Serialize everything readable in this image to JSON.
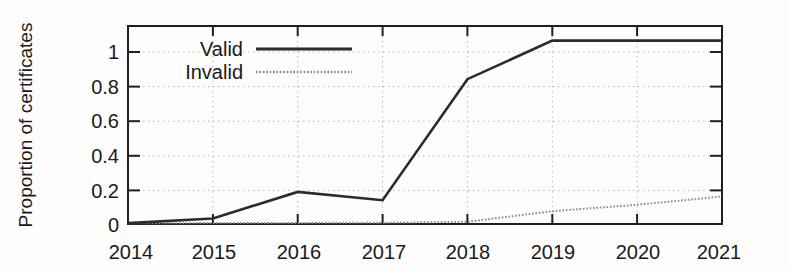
{
  "chart_data": {
    "type": "line",
    "title": "",
    "subtitle": "",
    "xlabel": "",
    "ylabel": "Proportion of certificates",
    "xlim": [
      2014,
      2021
    ],
    "ylim": [
      0,
      1.08
    ],
    "grid": true,
    "legend_position": "top-left",
    "x_ticks": [
      "2014",
      "2015",
      "2016",
      "2017",
      "2018",
      "2019",
      "2020",
      "2021"
    ],
    "y_ticks": [
      "0",
      "0.2",
      "0.4",
      "0.6",
      "0.8",
      "1"
    ],
    "x": [
      2014,
      2015,
      2016,
      2017,
      2018,
      2019,
      2020,
      2021
    ],
    "series": [
      {
        "name": "Valid",
        "color": "#2b2b2b",
        "style": "solid",
        "values": [
          0.005,
          0.03,
          0.175,
          0.13,
          0.79,
          1.0,
          1.0,
          1.0
        ]
      },
      {
        "name": "Invalid",
        "color": "#8c8c8c",
        "style": "dotted",
        "values": [
          0.004,
          0.005,
          0.006,
          0.007,
          0.012,
          0.07,
          0.105,
          0.15
        ]
      }
    ],
    "annotations": []
  },
  "legend": {
    "entries": [
      {
        "label": "Valid",
        "swatch": "valid-line-sample"
      },
      {
        "label": "Invalid",
        "swatch": "invalid-line-sample"
      }
    ]
  },
  "axis": {
    "y_title": "Proportion of certificates"
  },
  "colors": {
    "valid": "#2b2b2b",
    "invalid": "#8c8c8c",
    "grid": "#b8b8b8",
    "frame": "#1f1f1f",
    "background": "#fdfdfd"
  }
}
